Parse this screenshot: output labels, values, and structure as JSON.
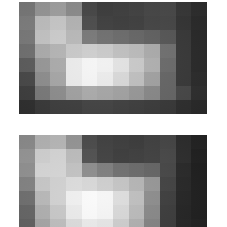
{
  "panels": [
    {
      "id": "top",
      "cols": 12,
      "rows": 8,
      "grid": [
        [
          120,
          150,
          160,
          140,
          70,
          60,
          62,
          65,
          70,
          72,
          55,
          45
        ],
        [
          125,
          190,
          200,
          180,
          75,
          62,
          60,
          62,
          68,
          70,
          52,
          42
        ],
        [
          120,
          195,
          205,
          185,
          120,
          110,
          105,
          100,
          95,
          85,
          55,
          40
        ],
        [
          110,
          170,
          180,
          200,
          205,
          200,
          190,
          185,
          170,
          110,
          55,
          40
        ],
        [
          90,
          150,
          170,
          235,
          245,
          240,
          225,
          200,
          175,
          105,
          55,
          40
        ],
        [
          70,
          140,
          165,
          235,
          245,
          235,
          215,
          190,
          160,
          100,
          55,
          42
        ],
        [
          60,
          120,
          140,
          160,
          170,
          165,
          160,
          150,
          135,
          100,
          70,
          45
        ],
        [
          45,
          55,
          60,
          60,
          65,
          65,
          62,
          60,
          58,
          55,
          45,
          40
        ]
      ]
    },
    {
      "id": "bottom",
      "cols": 12,
      "rows": 8,
      "grid": [
        [
          140,
          180,
          185,
          150,
          75,
          65,
          62,
          60,
          65,
          70,
          45,
          35
        ],
        [
          150,
          210,
          215,
          190,
          80,
          65,
          60,
          62,
          65,
          72,
          45,
          32
        ],
        [
          145,
          215,
          215,
          195,
          140,
          125,
          110,
          105,
          100,
          70,
          40,
          30
        ],
        [
          130,
          200,
          210,
          220,
          215,
          205,
          195,
          180,
          150,
          65,
          38,
          30
        ],
        [
          110,
          185,
          210,
          240,
          250,
          245,
          220,
          190,
          140,
          60,
          36,
          30
        ],
        [
          100,
          175,
          200,
          235,
          250,
          245,
          215,
          185,
          135,
          58,
          35,
          30
        ],
        [
          95,
          165,
          190,
          220,
          235,
          230,
          205,
          175,
          130,
          58,
          36,
          32
        ],
        [
          90,
          150,
          175,
          200,
          210,
          205,
          190,
          165,
          125,
          60,
          38,
          34
        ]
      ]
    }
  ]
}
